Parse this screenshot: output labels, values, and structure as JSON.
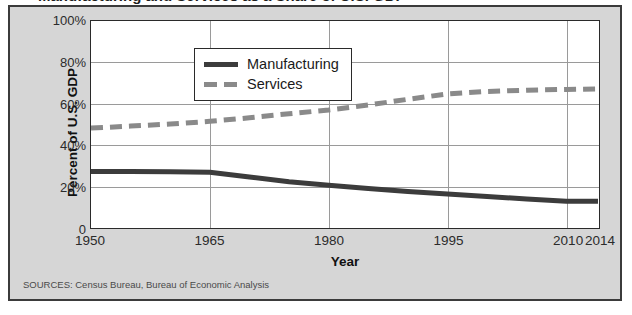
{
  "figure": {
    "cropped_title": "Manufacturing and Services as a Share of U.S. GDP",
    "sources_note": "SOURCES: Census Bureau, Bureau of Economic Analysis",
    "panel_background": "#d6d6d6",
    "plot_background": "#ffffff",
    "border_color": "#3b3b3b",
    "gridline_color": "#9a9a9a"
  },
  "legend": {
    "position": "top-left-inside",
    "entries": [
      {
        "label": "Manufacturing",
        "color": "#3c3c3c",
        "style": "solid"
      },
      {
        "label": "Services",
        "color": "#8a8a8a",
        "style": "dashed"
      }
    ]
  },
  "axes": {
    "y": {
      "title": "Percent of U.S. GDP",
      "ticks": [
        "0",
        "20%",
        "40%",
        "60%",
        "80%",
        "100%"
      ],
      "tick_values": [
        0,
        20,
        40,
        60,
        80,
        100
      ],
      "min": 0,
      "max": 100
    },
    "x": {
      "title": "Year",
      "ticks": [
        "1950",
        "1965",
        "1980",
        "1995",
        "2010",
        "2014"
      ],
      "tick_values": [
        1950,
        1965,
        1980,
        1995,
        2010,
        2014
      ],
      "min": 1950,
      "max": 2014
    }
  },
  "chart_data": {
    "type": "line",
    "title": "Manufacturing and Services as a Share of U.S. GDP",
    "xlabel": "Year",
    "ylabel": "Percent of U.S. GDP",
    "xlim": [
      1950,
      2014
    ],
    "ylim": [
      0,
      100
    ],
    "grid": true,
    "legend_position": "upper left",
    "x": [
      1950,
      1955,
      1960,
      1965,
      1970,
      1975,
      1980,
      1985,
      1990,
      1995,
      2000,
      2005,
      2010,
      2014
    ],
    "series": [
      {
        "name": "Manufacturing",
        "color": "#3c3c3c",
        "style": "solid",
        "values": [
          27.0,
          26.9,
          26.8,
          26.6,
          24.3,
          22.0,
          20.3,
          18.7,
          17.2,
          16.0,
          14.8,
          13.6,
          12.5,
          12.5
        ]
      },
      {
        "name": "Services",
        "color": "#8a8a8a",
        "style": "dashed",
        "values": [
          48.0,
          49.0,
          50.0,
          51.3,
          53.0,
          55.0,
          56.8,
          59.2,
          62.0,
          64.6,
          65.8,
          66.4,
          66.8,
          67.0
        ]
      }
    ]
  }
}
